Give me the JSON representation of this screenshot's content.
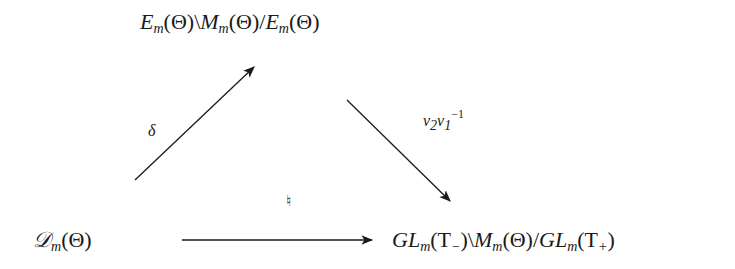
{
  "diagram": {
    "type": "commutative-triangle",
    "nodes": {
      "top": {
        "E": "E",
        "sub1": "m",
        "arg1": "(Θ)",
        "sep1": "\\",
        "M": "M",
        "sub2": "m",
        "arg2": "(Θ)",
        "sep2": "/",
        "E2": "E",
        "sub3": "m",
        "arg3": "(Θ)",
        "full": "E_m(Θ)\\M_m(Θ)/E_m(Θ)"
      },
      "bottom_left": {
        "D": "𝒟",
        "sub": "m",
        "arg": "(Θ)",
        "full": "𝒟_m(Θ)"
      },
      "bottom_right": {
        "GL": "GL",
        "sub1": "m",
        "arg1a": "(T",
        "arg1sub": "−",
        "arg1b": ")",
        "sep1": "\\",
        "M": "M",
        "sub2": "m",
        "arg2": "(Θ)",
        "sep2": "/",
        "GL2": "GL",
        "sub3": "m",
        "arg3a": "(T",
        "arg3sub": "+",
        "arg3b": ")",
        "full": "GL_m(T−)\\M_m(Θ)/GL_m(T+)"
      }
    },
    "arrows": [
      {
        "from": "bottom_left",
        "to": "top",
        "label": "δ"
      },
      {
        "from": "top",
        "to": "bottom_right",
        "label_base": "ν",
        "label_sub_a": "2",
        "label_base2": "ν",
        "label_sub_b": "1",
        "label_sup": "−1"
      },
      {
        "from": "bottom_left",
        "to": "bottom_right",
        "label": "♮"
      }
    ],
    "colors": {
      "ink": "#1a1a1a",
      "background": "#ffffff"
    }
  }
}
